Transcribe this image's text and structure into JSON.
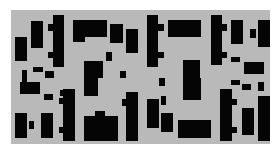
{
  "canvas": {
    "width": 276,
    "height": 156,
    "background": "#ffffff"
  },
  "panel": {
    "x": 11,
    "y": 10,
    "w": 259,
    "h": 134,
    "color": "#b9b9b9"
  },
  "block_color": "#050505",
  "blocks": [
    [
      15,
      37,
      12,
      24
    ],
    [
      22,
      70,
      5,
      12
    ],
    [
      31,
      21,
      12,
      27
    ],
    [
      33,
      67,
      10,
      5
    ],
    [
      45,
      71,
      9,
      7
    ],
    [
      53,
      15,
      11,
      52
    ],
    [
      48,
      24,
      5,
      7
    ],
    [
      48,
      52,
      5,
      6
    ],
    [
      73,
      20,
      34,
      17
    ],
    [
      73,
      37,
      12,
      5
    ],
    [
      84,
      61,
      19,
      17
    ],
    [
      84,
      78,
      14,
      18
    ],
    [
      106,
      52,
      6,
      9
    ],
    [
      110,
      24,
      13,
      19
    ],
    [
      120,
      71,
      6,
      7
    ],
    [
      126,
      29,
      12,
      24
    ],
    [
      20,
      82,
      20,
      12
    ],
    [
      44,
      94,
      9,
      6
    ],
    [
      60,
      90,
      5,
      6
    ],
    [
      63,
      89,
      12,
      52
    ],
    [
      59,
      98,
      5,
      6
    ],
    [
      59,
      127,
      5,
      6
    ],
    [
      15,
      113,
      12,
      25
    ],
    [
      29,
      121,
      5,
      8
    ],
    [
      41,
      113,
      12,
      25
    ],
    [
      84,
      116,
      34,
      25
    ],
    [
      95,
      111,
      10,
      6
    ],
    [
      126,
      92,
      12,
      49
    ],
    [
      122,
      99,
      5,
      7
    ],
    [
      147,
      15,
      11,
      52
    ],
    [
      158,
      24,
      6,
      7
    ],
    [
      158,
      52,
      6,
      6
    ],
    [
      168,
      20,
      33,
      17
    ],
    [
      183,
      60,
      17,
      18
    ],
    [
      183,
      78,
      18,
      22
    ],
    [
      211,
      15,
      11,
      50
    ],
    [
      222,
      24,
      5,
      7
    ],
    [
      222,
      52,
      5,
      6
    ],
    [
      231,
      20,
      12,
      24
    ],
    [
      250,
      29,
      6,
      9
    ],
    [
      258,
      20,
      12,
      27
    ],
    [
      231,
      57,
      9,
      5
    ],
    [
      244,
      62,
      20,
      12
    ],
    [
      159,
      78,
      6,
      8
    ],
    [
      147,
      99,
      12,
      29
    ],
    [
      161,
      96,
      5,
      9
    ],
    [
      161,
      113,
      12,
      19
    ],
    [
      178,
      120,
      33,
      18
    ],
    [
      220,
      89,
      12,
      52
    ],
    [
      232,
      99,
      5,
      6
    ],
    [
      232,
      127,
      5,
      6
    ],
    [
      231,
      80,
      9,
      5
    ],
    [
      242,
      84,
      9,
      6
    ],
    [
      258,
      82,
      6,
      9
    ],
    [
      242,
      108,
      12,
      27
    ],
    [
      258,
      96,
      12,
      29
    ],
    [
      258,
      125,
      12,
      16
    ]
  ]
}
